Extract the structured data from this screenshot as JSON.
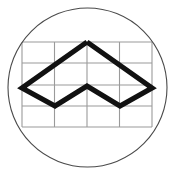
{
  "image": {
    "kind": "logo-emblem",
    "title": "Circular grid chevron emblem",
    "width": 175,
    "height": 175,
    "background_color": "#ffffff"
  },
  "colors": {
    "background": "#ffffff",
    "circle_stroke": "#4a4a4a",
    "grid_stroke": "#9a9a9a",
    "chevron_stroke": "#111111",
    "chevron_fill": "none"
  },
  "circle": {
    "name": "outer-circle",
    "center_x": 87.5,
    "center_y": 87.5,
    "radius": 79.5,
    "stroke_width": 1.1,
    "fill": "none"
  },
  "grid": {
    "name": "background-grid",
    "left": 22,
    "right": 152,
    "top": 42,
    "bottom": 127,
    "columns": 4,
    "rows": 4,
    "stroke_width": 1.1,
    "vertical_lines_x": [
      22,
      54.5,
      87,
      119.5,
      152
    ],
    "horizontal_lines_y": [
      42,
      63,
      85,
      106,
      127
    ]
  },
  "chevron": {
    "name": "chevron-polyline",
    "stroke_width": 5.2,
    "stroke_linejoin": "miter",
    "stroke_linecap": "butt",
    "closed": true,
    "points": [
      {
        "label": "top-apex",
        "x": 87,
        "y": 42
      },
      {
        "label": "right-vertex",
        "x": 152,
        "y": 88
      },
      {
        "label": "bottom-right-vertex",
        "x": 120,
        "y": 106
      },
      {
        "label": "center-inner-apex",
        "x": 87,
        "y": 86
      },
      {
        "label": "bottom-left-vertex",
        "x": 55,
        "y": 106
      },
      {
        "label": "left-vertex",
        "x": 22,
        "y": 88
      }
    ],
    "points_attr": "87,42 152,88 120,106 87,86 55,106 22,88 87,42"
  },
  "alt_text": "Black outlined circle containing a faint rectangular grid overlaid by a bold angular chevron shape resembling a stylized mountain or arrow."
}
